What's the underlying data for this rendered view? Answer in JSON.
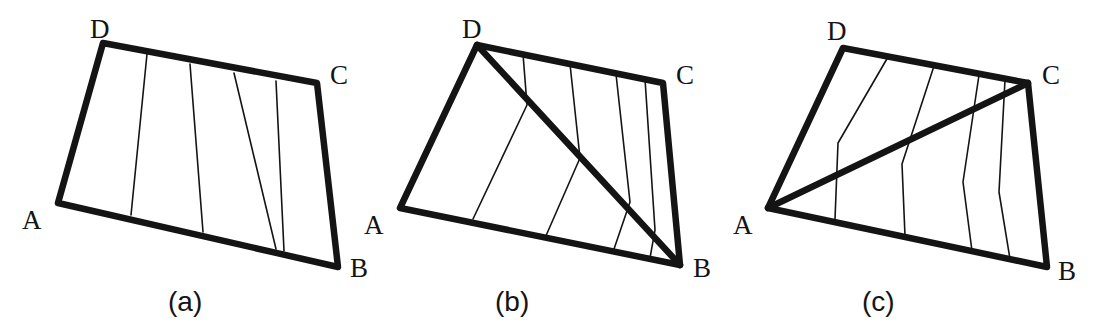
{
  "figure": {
    "width": 1102,
    "height": 327,
    "background_color": "#ffffff",
    "ink_color": "#141414",
    "thick_stroke_width": 6.5,
    "thin_stroke_width": 1.6
  },
  "panels": [
    {
      "id": "panel-a",
      "caption": "(a)",
      "caption_pos": {
        "x": 168,
        "y": 288
      },
      "vertices": {
        "A": {
          "x": 58,
          "y": 203
        },
        "B": {
          "x": 338,
          "y": 267
        },
        "C": {
          "x": 317,
          "y": 83
        },
        "D": {
          "x": 103,
          "y": 43
        }
      },
      "vertex_labels": [
        {
          "text": "D",
          "x": 90,
          "y": 16
        },
        {
          "text": "C",
          "x": 330,
          "y": 62
        },
        {
          "text": "A",
          "x": 22,
          "y": 207
        },
        {
          "text": "B",
          "x": 350,
          "y": 255
        }
      ],
      "diagonal": null,
      "strip_count": 5,
      "interior_lines": [
        [
          {
            "x": 147,
            "y": 54
          },
          {
            "x": 131,
            "y": 215
          }
        ],
        [
          {
            "x": 190,
            "y": 64
          },
          {
            "x": 203,
            "y": 232
          }
        ],
        [
          {
            "x": 234,
            "y": 73
          },
          {
            "x": 276,
            "y": 249
          }
        ],
        [
          {
            "x": 276,
            "y": 81
          },
          {
            "x": 284,
            "y": 251
          }
        ]
      ]
    },
    {
      "id": "panel-b",
      "caption": "(b)",
      "caption_pos": {
        "x": 495,
        "y": 288
      },
      "vertices": {
        "A": {
          "x": 400,
          "y": 208
        },
        "B": {
          "x": 680,
          "y": 265
        },
        "C": {
          "x": 663,
          "y": 83
        },
        "D": {
          "x": 477,
          "y": 45
        }
      },
      "vertex_labels": [
        {
          "text": "D",
          "x": 462,
          "y": 16
        },
        {
          "text": "C",
          "x": 676,
          "y": 62
        },
        {
          "text": "A",
          "x": 364,
          "y": 212
        },
        {
          "text": "B",
          "x": 693,
          "y": 255
        }
      ],
      "diagonal": {
        "from": "D",
        "to": "B"
      },
      "strip_count": 5,
      "interior_lines": [
        [
          {
            "x": 523,
            "y": 54
          },
          {
            "x": 527,
            "y": 105
          },
          {
            "x": 473,
            "y": 219
          }
        ],
        [
          {
            "x": 570,
            "y": 64
          },
          {
            "x": 580,
            "y": 158
          },
          {
            "x": 545,
            "y": 238
          }
        ],
        [
          {
            "x": 616,
            "y": 74
          },
          {
            "x": 630,
            "y": 202
          },
          {
            "x": 613,
            "y": 252
          }
        ],
        [
          {
            "x": 645,
            "y": 79
          },
          {
            "x": 655,
            "y": 230
          },
          {
            "x": 650,
            "y": 258
          }
        ]
      ]
    },
    {
      "id": "panel-c",
      "caption": "(c)",
      "caption_pos": {
        "x": 862,
        "y": 288
      },
      "vertices": {
        "A": {
          "x": 768,
          "y": 208
        },
        "B": {
          "x": 1047,
          "y": 267
        },
        "C": {
          "x": 1028,
          "y": 83
        },
        "D": {
          "x": 843,
          "y": 48
        }
      },
      "vertex_labels": [
        {
          "text": "D",
          "x": 827,
          "y": 18
        },
        {
          "text": "C",
          "x": 1042,
          "y": 62
        },
        {
          "text": "A",
          "x": 733,
          "y": 212
        },
        {
          "text": "B",
          "x": 1058,
          "y": 258
        }
      ],
      "diagonal": {
        "from": "A",
        "to": "C"
      },
      "strip_count": 5,
      "interior_lines": [
        [
          {
            "x": 888,
            "y": 57
          },
          {
            "x": 838,
            "y": 143
          },
          {
            "x": 835,
            "y": 219
          }
        ],
        [
          {
            "x": 934,
            "y": 66
          },
          {
            "x": 902,
            "y": 164
          },
          {
            "x": 905,
            "y": 236
          }
        ],
        [
          {
            "x": 979,
            "y": 75
          },
          {
            "x": 963,
            "y": 182
          },
          {
            "x": 972,
            "y": 251
          }
        ],
        [
          {
            "x": 1005,
            "y": 80
          },
          {
            "x": 999,
            "y": 192
          },
          {
            "x": 1010,
            "y": 259
          }
        ]
      ]
    }
  ]
}
